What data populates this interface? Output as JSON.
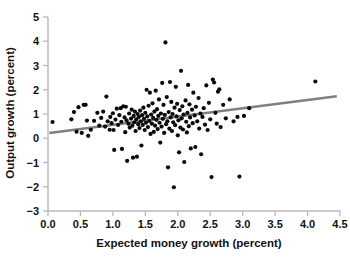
{
  "chart_data": {
    "type": "scatter",
    "title": "",
    "xlabel": "Expected money growth (percent)",
    "ylabel": "Output growth (percent)",
    "xlim": [
      0.0,
      4.5
    ],
    "ylim": [
      -3,
      5
    ],
    "grid": false,
    "legend": null,
    "xticks": [
      "0.0",
      "0.5",
      "1.0",
      "1.5",
      "2.0",
      "2.5",
      "3.0",
      "3.5",
      "4.0",
      "4.5"
    ],
    "xtick_values": [
      0.0,
      0.5,
      1.0,
      1.5,
      2.0,
      2.5,
      3.0,
      3.5,
      4.0,
      4.5
    ],
    "yticks": [
      "5",
      "4",
      "3",
      "2",
      "1",
      "0",
      "−1",
      "−2",
      "−3"
    ],
    "ytick_values": [
      5,
      4,
      3,
      2,
      1,
      0,
      -1,
      -2,
      -3
    ],
    "marker": {
      "shape": "circle",
      "color": "#0a0a0a",
      "size_px": 4.2
    },
    "trendline": {
      "name": "fitted regression line",
      "color": "#808080",
      "x_start": 0.02,
      "y_start": 0.22,
      "x_end": 4.45,
      "y_end": 1.73,
      "slope": 0.341,
      "intercept": 0.213
    },
    "points": [
      [
        0.07,
        0.67
      ],
      [
        0.36,
        0.78
      ],
      [
        0.4,
        1.08
      ],
      [
        0.44,
        0.27
      ],
      [
        0.47,
        1.28
      ],
      [
        0.52,
        0.22
      ],
      [
        0.55,
        1.38
      ],
      [
        0.58,
        1.38
      ],
      [
        0.6,
        0.73
      ],
      [
        0.62,
        0.1
      ],
      [
        0.66,
        0.35
      ],
      [
        0.71,
        0.72
      ],
      [
        0.76,
        1.05
      ],
      [
        0.79,
        0.52
      ],
      [
        0.82,
        0.84
      ],
      [
        0.85,
        1.1
      ],
      [
        0.88,
        0.48
      ],
      [
        0.9,
        1.72
      ],
      [
        0.92,
        0.7
      ],
      [
        0.95,
        0.35
      ],
      [
        0.96,
        0.88
      ],
      [
        0.98,
        0.62
      ],
      [
        1.0,
        1.03
      ],
      [
        1.01,
        0.34
      ],
      [
        1.02,
        -0.48
      ],
      [
        1.04,
        0.77
      ],
      [
        1.06,
        1.22
      ],
      [
        1.08,
        0.55
      ],
      [
        1.1,
        0.95
      ],
      [
        1.12,
        1.24
      ],
      [
        1.13,
        0.68
      ],
      [
        1.14,
        -0.44
      ],
      [
        1.16,
        1.32
      ],
      [
        1.18,
        0.86
      ],
      [
        1.19,
        0.25
      ],
      [
        1.2,
        1.3
      ],
      [
        1.21,
        0.74
      ],
      [
        1.22,
        -0.93
      ],
      [
        1.24,
        0.6
      ],
      [
        1.25,
        1.02
      ],
      [
        1.26,
        0.44
      ],
      [
        1.28,
        0.81
      ],
      [
        1.29,
        1.18
      ],
      [
        1.3,
        0.52
      ],
      [
        1.31,
        -0.8
      ],
      [
        1.32,
        0.92
      ],
      [
        1.33,
        0.66
      ],
      [
        1.34,
        1.1
      ],
      [
        1.35,
        0.3
      ],
      [
        1.36,
        0.78
      ],
      [
        1.37,
        -0.76
      ],
      [
        1.38,
        1.0
      ],
      [
        1.39,
        0.58
      ],
      [
        1.4,
        0.88
      ],
      [
        1.41,
        0.42
      ],
      [
        1.42,
        1.14
      ],
      [
        1.43,
        0.7
      ],
      [
        1.44,
        -0.3
      ],
      [
        1.45,
        0.95
      ],
      [
        1.46,
        0.55
      ],
      [
        1.47,
        1.26
      ],
      [
        1.48,
        0.8
      ],
      [
        1.49,
        0.34
      ],
      [
        1.5,
        1.05
      ],
      [
        1.51,
        0.64
      ],
      [
        1.52,
        2.0
      ],
      [
        1.53,
        0.9
      ],
      [
        1.54,
        0.46
      ],
      [
        1.55,
        1.34
      ],
      [
        1.56,
        0.72
      ],
      [
        1.57,
        1.88
      ],
      [
        1.58,
        0.18
      ],
      [
        1.59,
        0.98
      ],
      [
        1.6,
        0.6
      ],
      [
        1.61,
        1.44
      ],
      [
        1.62,
        0.84
      ],
      [
        1.63,
        0.26
      ],
      [
        1.64,
        1.1
      ],
      [
        1.65,
        0.52
      ],
      [
        1.66,
        1.96
      ],
      [
        1.67,
        0.76
      ],
      [
        1.68,
        1.2
      ],
      [
        1.69,
        0.38
      ],
      [
        1.7,
        0.92
      ],
      [
        1.71,
        1.6
      ],
      [
        1.72,
        0.64
      ],
      [
        1.73,
        -0.18
      ],
      [
        1.74,
        1.02
      ],
      [
        1.75,
        0.48
      ],
      [
        1.76,
        2.28
      ],
      [
        1.77,
        0.8
      ],
      [
        1.78,
        1.38
      ],
      [
        1.79,
        0.22
      ],
      [
        1.8,
        0.96
      ],
      [
        1.81,
        3.95
      ],
      [
        1.82,
        0.58
      ],
      [
        1.83,
        1.7
      ],
      [
        1.84,
        0.7
      ],
      [
        1.85,
        -1.2
      ],
      [
        1.86,
        1.08
      ],
      [
        1.87,
        0.4
      ],
      [
        1.88,
        2.32
      ],
      [
        1.89,
        0.86
      ],
      [
        1.9,
        1.5
      ],
      [
        1.91,
        0.3
      ],
      [
        1.92,
        1.0
      ],
      [
        1.93,
        0.66
      ],
      [
        1.94,
        -2.02
      ],
      [
        1.95,
        1.26
      ],
      [
        1.96,
        0.54
      ],
      [
        1.97,
        2.12
      ],
      [
        1.98,
        0.9
      ],
      [
        1.99,
        1.42
      ],
      [
        2.0,
        0.12
      ],
      [
        2.01,
        0.74
      ],
      [
        2.02,
        -0.58
      ],
      [
        2.03,
        1.16
      ],
      [
        2.04,
        0.44
      ],
      [
        2.05,
        2.78
      ],
      [
        2.06,
        0.82
      ],
      [
        2.07,
        1.32
      ],
      [
        2.08,
        0.36
      ],
      [
        2.09,
        0.98
      ],
      [
        2.1,
        -0.98
      ],
      [
        2.12,
        1.56
      ],
      [
        2.13,
        0.68
      ],
      [
        2.14,
        0.24
      ],
      [
        2.15,
        1.05
      ],
      [
        2.16,
        2.2
      ],
      [
        2.17,
        0.5
      ],
      [
        2.18,
        1.4
      ],
      [
        2.19,
        0.86
      ],
      [
        2.2,
        -0.42
      ],
      [
        2.22,
        1.18
      ],
      [
        2.23,
        0.62
      ],
      [
        2.24,
        1.88
      ],
      [
        2.26,
        0.94
      ],
      [
        2.27,
        -0.36
      ],
      [
        2.28,
        1.3
      ],
      [
        2.3,
        0.7
      ],
      [
        2.32,
        1.66
      ],
      [
        2.33,
        0.4
      ],
      [
        2.35,
        1.02
      ],
      [
        2.36,
        -0.66
      ],
      [
        2.38,
        0.88
      ],
      [
        2.4,
        1.24
      ],
      [
        2.42,
        0.56
      ],
      [
        2.44,
        2.18
      ],
      [
        2.46,
        0.34
      ],
      [
        2.48,
        1.46
      ],
      [
        2.5,
        0.78
      ],
      [
        2.52,
        -1.6
      ],
      [
        2.54,
        2.42
      ],
      [
        2.56,
        2.3
      ],
      [
        2.58,
        1.05
      ],
      [
        2.6,
        0.6
      ],
      [
        2.62,
        1.92
      ],
      [
        2.64,
        2.02
      ],
      [
        2.66,
        0.46
      ],
      [
        2.7,
        1.38
      ],
      [
        2.74,
        0.82
      ],
      [
        2.8,
        1.6
      ],
      [
        2.86,
        0.7
      ],
      [
        2.92,
        0.88
      ],
      [
        2.95,
        -1.58
      ],
      [
        3.02,
        0.92
      ],
      [
        3.1,
        1.24
      ],
      [
        4.12,
        2.34
      ]
    ]
  }
}
